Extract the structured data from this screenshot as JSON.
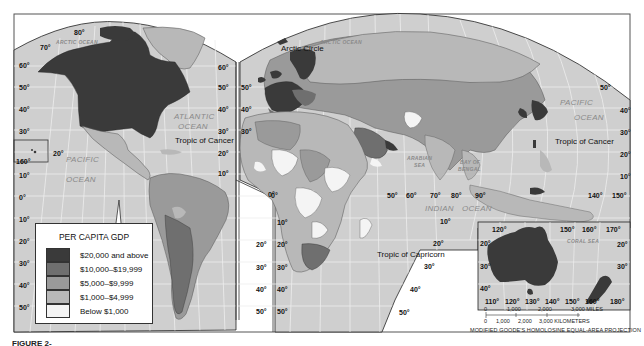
{
  "map": {
    "title_legend": "PER CAPITA GDP",
    "projection": "MODIFIED GOODE'S HOMOLOSINE EQUAL-AREA PROJECTION",
    "caption": "FIGURE 2-"
  },
  "colors": {
    "ocean": "#cfcfcf",
    "graticule": "#eeeeee",
    "frame": "#333333",
    "tier_20000_plus": "#3a3a3a",
    "tier_10000_19999": "#6f6f6f",
    "tier_5000_9999": "#9a9a9a",
    "tier_1000_4999": "#b8b8b8",
    "tier_below_1000": "#f4f4f4",
    "background": "#ffffff"
  },
  "legend": {
    "title": "PER CAPITA GDP",
    "items": [
      {
        "label": "$20,000 and above",
        "color": "#3a3a3a"
      },
      {
        "label": "$10,000–$19,999",
        "color": "#6f6f6f"
      },
      {
        "label": "$5,000–$9,999",
        "color": "#9a9a9a"
      },
      {
        "label": "$1,000–$4,999",
        "color": "#b8b8b8"
      },
      {
        "label": "Below $1,000",
        "color": "#f4f4f4"
      }
    ]
  },
  "features": {
    "arctic_circle": "Arctic Circle",
    "tropic_cancer": "Tropic of Cancer",
    "tropic_capricorn": "Tropic of Capricorn"
  },
  "oceans": {
    "arctic": "ARCTIC OCEAN",
    "arctic_east": "ARCTIC OCEAN",
    "atlantic_1": "ATLANTIC",
    "atlantic_2": "OCEAN",
    "pacific_w_1": "PACIFIC",
    "pacific_w_2": "OCEAN",
    "pacific_e_1": "PACIFIC",
    "pacific_e_2": "OCEAN",
    "indian_1": "INDIAN",
    "indian_2": "OCEAN",
    "arabian_1": "ARABIAN",
    "arabian_2": "SEA",
    "bengal_1": "BAY OF",
    "bengal_2": "BENGAL",
    "coral": "CORAL SEA"
  },
  "graticule_labels": {
    "na_left": [
      "60°",
      "50°",
      "40°",
      "30°",
      "10°",
      "0°",
      "10°",
      "20°",
      "30°",
      "40°",
      "50°"
    ],
    "na_top": [
      "70°",
      "80°"
    ],
    "hawaii": [
      "20°",
      "160°"
    ],
    "na_right": [
      "60°",
      "50°",
      "40°",
      "30°",
      "20°",
      "10°"
    ],
    "sa_right": [
      "0°",
      "20°",
      "30°",
      "40°",
      "50°"
    ],
    "eu_left": [
      "50°",
      "40°",
      "30°"
    ],
    "af_left": [
      "10°",
      "20°",
      "30°",
      "40°",
      "50°"
    ],
    "af_equator": "0°",
    "af_longitudes": [
      "50°",
      "60°",
      "70°",
      "80°",
      "90°"
    ],
    "af_right": [
      "10°",
      "20°",
      "30°",
      "40°",
      "50°"
    ],
    "asia_right": [
      "50°",
      "40°",
      "30°",
      "20°",
      "10°"
    ],
    "asia_bottom": [
      "140°",
      "150°"
    ],
    "aus_top": [
      "120°",
      "150°",
      "160°",
      "170°"
    ],
    "aus_left": [
      "20°",
      "30°",
      "40°"
    ],
    "aus_right": [
      "20°",
      "30°"
    ],
    "aus_bottom": [
      "110°",
      "120°",
      "130°",
      "140°",
      "150°",
      "160°",
      "180°"
    ]
  },
  "scale": {
    "miles": [
      "0",
      "1,000",
      "2,000",
      "3,000 MILES"
    ],
    "km": [
      "0",
      "1,000",
      "2,000",
      "3,000 KILOMETERS"
    ]
  }
}
